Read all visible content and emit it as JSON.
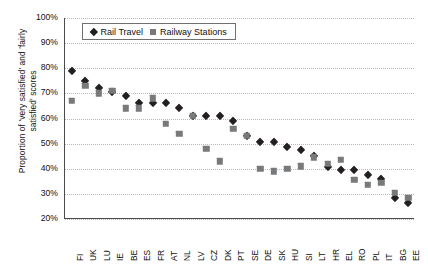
{
  "chart_data": {
    "type": "scatter",
    "title": "",
    "xlabel": "",
    "ylabel": "Proportion of 'very satisfied' and 'fairly satisfied' scores",
    "ylim": [
      20,
      100
    ],
    "ytick_labels": [
      "100%",
      "90%",
      "80%",
      "70%",
      "60%",
      "50%",
      "40%",
      "30%",
      "20%"
    ],
    "ytick_values": [
      100,
      90,
      80,
      70,
      60,
      50,
      40,
      30,
      20
    ],
    "grid": true,
    "legend_position": "top-left-inside",
    "categories": [
      "FI",
      "UK",
      "LU",
      "IE",
      "BE",
      "ES",
      "FR",
      "AT",
      "NL",
      "LV",
      "CZ",
      "DK",
      "PT",
      "SE",
      "DE",
      "SK",
      "HU",
      "SI",
      "LT",
      "HR",
      "EL",
      "RO",
      "PL",
      "IT",
      "BG",
      "EE"
    ],
    "series": [
      {
        "name": "Rail Travel",
        "marker": "diamond",
        "color": "#231f20",
        "values": [
          79,
          75,
          72,
          70.5,
          69,
          66,
          66,
          66,
          64,
          61,
          61,
          61,
          59,
          53,
          50.5,
          50.5,
          48.5,
          47.5,
          45,
          40.5,
          39.5,
          39.5,
          37.5,
          36,
          28.5,
          26.5
        ]
      },
      {
        "name": "Railway Stations",
        "marker": "square",
        "color": "#77797b",
        "values": [
          67,
          73,
          70,
          71,
          64,
          64,
          68,
          58,
          54,
          61,
          48,
          43,
          56,
          53,
          40,
          39,
          40,
          41,
          44.5,
          42,
          43.5,
          35.5,
          33.5,
          34.5,
          30.5,
          28.5
        ]
      }
    ]
  },
  "legend": {
    "items": [
      {
        "label": "Rail Travel",
        "marker": "diamond"
      },
      {
        "label": "Railway Stations",
        "marker": "square"
      }
    ]
  },
  "axis": {
    "y_title": "Proportion of 'very satisfied' and 'fairly\nsatisfied' scores"
  }
}
